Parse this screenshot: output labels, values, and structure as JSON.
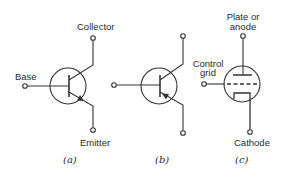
{
  "figure": {
    "stroke_color": "#333333",
    "background": "#ffffff",
    "panels": [
      {
        "id": "a",
        "caption": "(a)",
        "type": "transistor-npn",
        "labels": {
          "collector": "Collector",
          "base": "Base",
          "emitter": "Emitter"
        }
      },
      {
        "id": "b",
        "caption": "(b)",
        "type": "transistor-pnp",
        "labels": {}
      },
      {
        "id": "c",
        "caption": "(c)",
        "type": "vacuum-tube-triode",
        "labels": {
          "plate_line1": "Plate or",
          "plate_line2": "anode",
          "grid_line1": "Control",
          "grid_line2": "grid",
          "cathode": "Cathode"
        }
      }
    ]
  }
}
